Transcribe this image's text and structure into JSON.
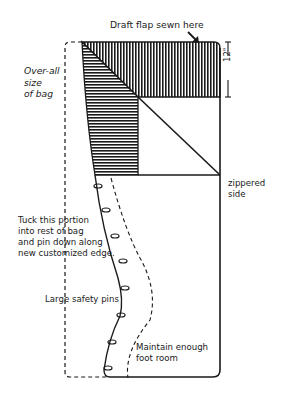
{
  "diagram": {
    "type": "sleeping bag customization sketch",
    "labels": {
      "draft_flap": "Draft flap sewn here",
      "overall_size": "Over-all\nsize\nof bag",
      "dimension": "12\"",
      "zippered_side": "zippered\nside",
      "tuck_instruction": "Tuck this portion\ninto rest of bag\nand pin down along\nnew customized edge.",
      "safety_pins": "Large safety pins",
      "foot_room": "Maintain enough\nfoot room"
    },
    "colors": {
      "ink": "#1a1a1a",
      "background": "#ffffff"
    },
    "safety_pin_count": 7
  }
}
